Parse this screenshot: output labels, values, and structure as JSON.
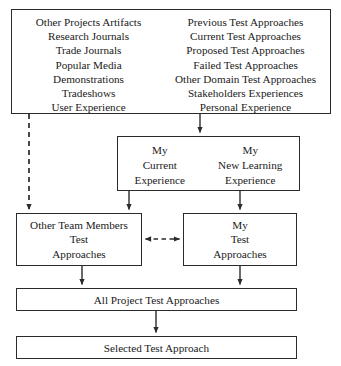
{
  "diagram": {
    "ink_color": "#2b2b2b",
    "background_color": "#ffffff"
  },
  "sources_box": {
    "left_column": [
      "Other Projects Artifacts",
      "Research Journals",
      "Trade Journals",
      "Popular Media",
      "Demonstrations",
      "Tradeshows",
      "User Experience"
    ],
    "right_column": [
      "Previous Test Approaches",
      "Current Test Approaches",
      "Proposed Test Approaches",
      "Failed Test Approaches",
      "Other Domain Test Approaches",
      "Stakeholders Experiences",
      "Personal Experience"
    ]
  },
  "experience_box": {
    "left_column": [
      "My",
      "Current",
      "Experience"
    ],
    "right_column": [
      "My",
      "New Learning",
      "Experience"
    ]
  },
  "other_team_box": {
    "lines": [
      "Other Team Members",
      "Test",
      "Approaches"
    ]
  },
  "my_test_box": {
    "lines": [
      "My",
      "Test",
      "Approaches"
    ]
  },
  "all_approaches_bar": {
    "label": "All Project Test Approaches"
  },
  "selected_approach_bar": {
    "label": "Selected Test Approach"
  },
  "connectors": [
    {
      "name": "sources-to-experience-arrow",
      "style": "solid",
      "direction": "down",
      "from": "sources_box",
      "to": "experience_box"
    },
    {
      "name": "sources-to-other-team-dashed-arrow",
      "style": "dashed",
      "direction": "down",
      "from": "sources_box",
      "to": "other_team_box"
    },
    {
      "name": "experience-to-other-team-arrow",
      "style": "solid",
      "direction": "down",
      "from": "experience_box",
      "to": "other_team_box"
    },
    {
      "name": "experience-to-my-test-arrow",
      "style": "solid",
      "direction": "down",
      "from": "experience_box",
      "to": "my_test_box"
    },
    {
      "name": "other-team-to-my-test-bidirectional-dashed-arrow",
      "style": "dashed",
      "direction": "both",
      "from": "other_team_box",
      "to": "my_test_box"
    },
    {
      "name": "other-team-to-all-approaches-arrow",
      "style": "solid",
      "direction": "down",
      "from": "other_team_box",
      "to": "all_approaches_bar"
    },
    {
      "name": "my-test-to-all-approaches-arrow",
      "style": "solid",
      "direction": "down",
      "from": "my_test_box",
      "to": "all_approaches_bar"
    },
    {
      "name": "all-approaches-to-selected-arrow",
      "style": "solid",
      "direction": "down",
      "from": "all_approaches_bar",
      "to": "selected_approach_bar"
    }
  ]
}
